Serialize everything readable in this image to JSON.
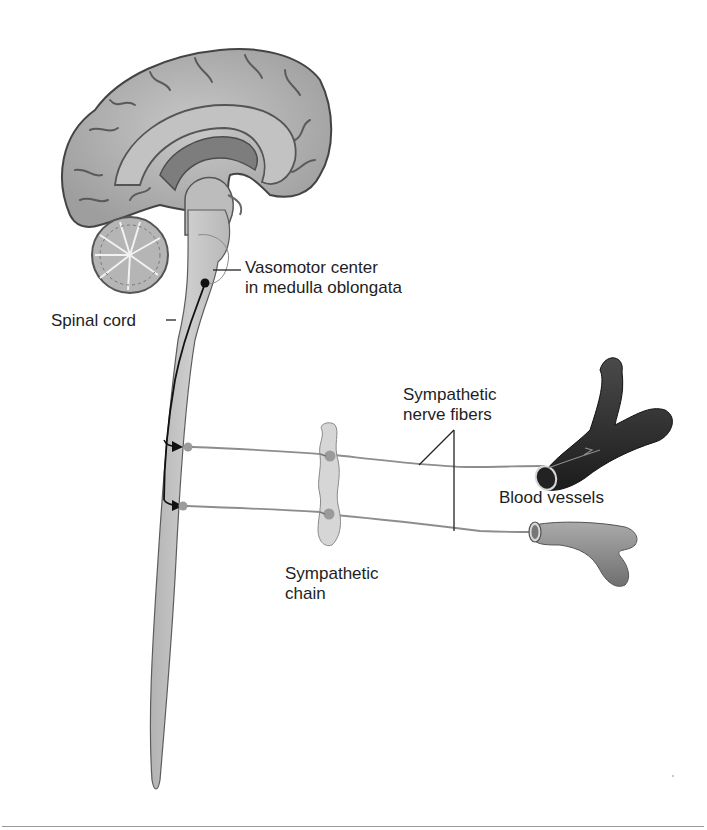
{
  "figure": {
    "labels": {
      "vasomotor_line1": "Vasomotor center",
      "vasomotor_line2": "in medulla oblongata",
      "spinal_cord": "Spinal cord",
      "nerve_fibers_line1": "Sympathetic",
      "nerve_fibers_line2": "nerve fibers",
      "blood_vessels": "Blood vessels",
      "chain_line1": "Sympathetic",
      "chain_line2": "chain"
    },
    "colors": {
      "brain_fill": "#b9b9b9",
      "brain_stroke": "#555555",
      "cord_fill": "#c4c4c4",
      "nerve_line": "#8a8a8a",
      "neuron_tract": "#111111",
      "vessel_dark": "#2e2e2e",
      "vessel_light": "#8c8c8c",
      "ganglion": "#a0a0a0"
    }
  }
}
